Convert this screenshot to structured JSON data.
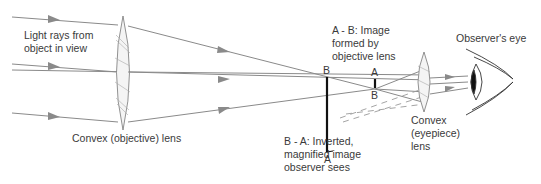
{
  "diagram": {
    "labels": {
      "light_rays": [
        "Light rays from",
        "object in view"
      ],
      "objective_lens": "Convex (objective) lens",
      "image_ab": [
        "A - B: Image",
        "formed by",
        "objective lens"
      ],
      "image_ba": [
        "B - A: Inverted,",
        "magnified image",
        "observer sees"
      ],
      "eyepiece_lens": [
        "Convex",
        "(eyepiece)",
        "lens"
      ],
      "observer_eye": "Observer's eye"
    },
    "points": {
      "virtual_B": "B",
      "virtual_A": "A",
      "real_A": "A",
      "real_B": "B"
    },
    "colors": {
      "ray": "#8a8a8a",
      "lens": "#777777",
      "image": "#111111",
      "text": "#3a3a3a"
    }
  }
}
